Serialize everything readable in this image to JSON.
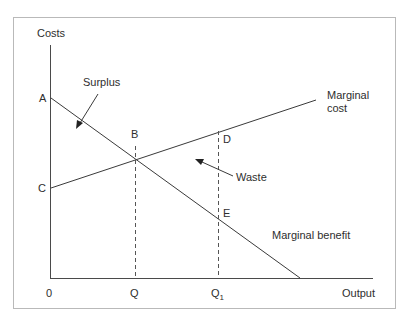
{
  "diagram": {
    "axes": {
      "y_label": "Costs",
      "x_label": "Output",
      "origin_label": "0"
    },
    "points": {
      "A": "A",
      "B": "B",
      "C": "C",
      "D": "D",
      "E": "E"
    },
    "x_ticks": {
      "Q": "Q",
      "Q1_base": "Q",
      "Q1_sub": "1"
    },
    "curves": {
      "marginal_cost_line1": "Marginal",
      "marginal_cost_line2": "cost",
      "marginal_benefit": "Marginal benefit"
    },
    "annotations": {
      "surplus": "Surplus",
      "waste": "Waste"
    },
    "colors": {
      "line": "#3a3a3a",
      "axis": "#4a4a4a",
      "frame": "#b9b9b9"
    }
  }
}
